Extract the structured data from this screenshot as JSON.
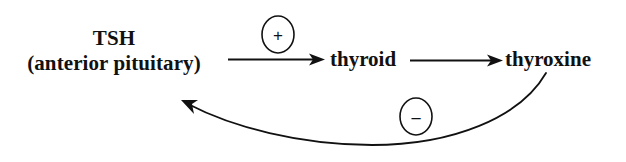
{
  "diagram": {
    "background_color": "#ffffff",
    "stroke_color": "#111111",
    "nodes": [
      {
        "id": "tsh",
        "line_1": "TSH",
        "line_2": "(anterior pituitary)"
      },
      {
        "id": "thyroid",
        "label": "thyroid"
      },
      {
        "id": "thyroxine",
        "label": "thyroxine"
      }
    ],
    "edges": [
      {
        "id": "tsh-to-thyroid",
        "from": "tsh",
        "to": "thyroid",
        "style": "straight",
        "sign": "+"
      },
      {
        "id": "thyroid-to-thyroxine",
        "from": "thyroid",
        "to": "thyroxine",
        "style": "straight",
        "sign": ""
      },
      {
        "id": "thyroxine-to-tsh",
        "from": "thyroxine",
        "to": "tsh",
        "style": "curved",
        "sign": "−"
      }
    ],
    "signs": {
      "positive": "+",
      "negative": "−"
    }
  }
}
